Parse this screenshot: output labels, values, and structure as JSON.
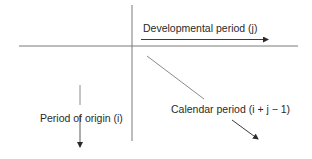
{
  "diagram": {
    "type": "run-off triangle axes",
    "labels": {
      "developmental": "Developmental period (j)",
      "origin": "Period of origin (i)",
      "calendar": "Calendar period (i + j − 1)"
    },
    "colors": {
      "line": "#6e6e6e",
      "arrow": "#2a2a2a",
      "text": "#2a2a2a",
      "background": "#ffffff"
    },
    "arrows": [
      {
        "name": "developmental-period-arrow",
        "direction": "right"
      },
      {
        "name": "period-of-origin-arrow",
        "direction": "down"
      },
      {
        "name": "calendar-period-arrow",
        "direction": "down-right"
      }
    ]
  }
}
